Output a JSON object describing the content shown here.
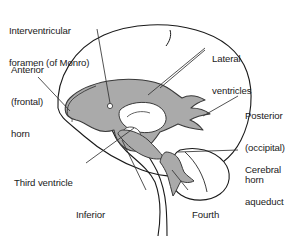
{
  "figure": {
    "background_color": "#ffffff",
    "outline_color": "#1a1a1a",
    "ventricle_fill_color": "#aaaaaa",
    "ventricle_void_color": "#ffffff",
    "leader_line_color": "#333333",
    "text_color": "#1a1a1a"
  },
  "labels": {
    "interventricular_foramen": {
      "line1": "Interventricular",
      "line2": "foramen (of Monro)"
    },
    "anterior_horn": {
      "line1": "Anterior",
      "line2": "(frontal)",
      "line3": "horn"
    },
    "lateral_ventricles": {
      "line1": "Lateral",
      "line2": "ventricles"
    },
    "posterior_horn": {
      "line1": "Posterior",
      "line2": "(occipital)",
      "line3": "horn"
    },
    "cerebral_aqueduct": {
      "line1": "Cerebral",
      "line2": "aqueduct"
    },
    "third_ventricle": {
      "line1": "Third ventricle"
    },
    "inferior_horn": {
      "line1": "Inferior",
      "line2": "(temporal) horn"
    },
    "fourth_ventricle": {
      "line1": "Fourth",
      "line2": "ventricle"
    }
  }
}
